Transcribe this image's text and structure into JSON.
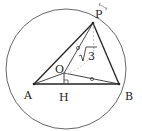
{
  "diagram": {
    "type": "geometry",
    "points": {
      "P": {
        "label": "P",
        "x": 93,
        "y": 23
      },
      "A": {
        "label": "A",
        "x": 34,
        "y": 84
      },
      "B": {
        "label": "B",
        "x": 119,
        "y": 84
      },
      "O": {
        "label": "O",
        "x": 64,
        "y": 73
      },
      "H": {
        "label": "H",
        "x": 64,
        "y": 84
      }
    },
    "circle": {
      "cx": 66,
      "cy": 69,
      "r": 60
    },
    "annotations": {
      "length_label": "√3",
      "sqrt_symbol": "√",
      "sqrt_value": "3"
    },
    "colors": {
      "stroke": "#333333",
      "circle": "#555555",
      "dashed": "#999999"
    }
  }
}
